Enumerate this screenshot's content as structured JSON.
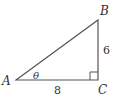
{
  "diagram": {
    "type": "right-triangle",
    "colors": {
      "stroke": "#555555",
      "text": "#333333",
      "background": "#ffffff"
    },
    "vertices": {
      "A": {
        "label": "A",
        "x": 16,
        "y": 80
      },
      "B": {
        "label": "B",
        "x": 98,
        "y": 20
      },
      "C": {
        "label": "C",
        "x": 98,
        "y": 80
      }
    },
    "angle_label": "θ",
    "right_angle_at": "C",
    "sides": {
      "AC": {
        "length_label": "8"
      },
      "BC": {
        "length_label": "6"
      }
    }
  }
}
